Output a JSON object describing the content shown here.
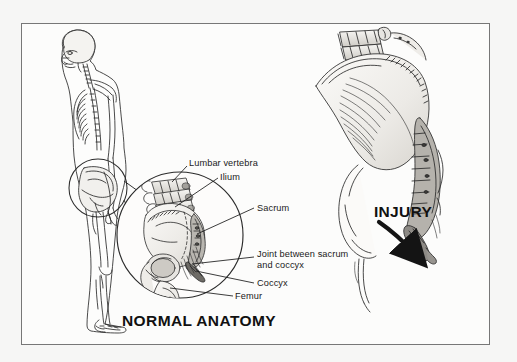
{
  "figure": {
    "background_color": "#f6f6f5",
    "panel_color": "#fcfcfb",
    "frame_color": "#777777",
    "ink_color": "#1a1a1a",
    "bone_fill": "#f0efed",
    "shade_fill": "#c9c7c3"
  },
  "titles": {
    "normal_anatomy": "NORMAL ANATOMY",
    "injury": "INJURY"
  },
  "labels": {
    "lumbar_vertebra": "Lumbar vertebra",
    "ilium": "Ilium",
    "sacrum": "Sacrum",
    "joint_line_1": "Joint between sacrum",
    "joint_line_2": "and coccyx",
    "coccyx": "Coccyx",
    "femur": "Femur"
  },
  "panels": {
    "left": {
      "name": "normal-anatomy-panel",
      "figure_description": "lateral full-body skeleton",
      "callout_description": "circular magnified pelvis inset"
    },
    "right": {
      "name": "injury-panel",
      "figure_description": "sagittal pelvis with sacrum and coccyx",
      "arrow": "curved-down-right-arrow"
    }
  },
  "icons": {
    "magnify_circle": "magnifier-circle-icon",
    "injury_arrow": "curved-arrow-icon"
  }
}
